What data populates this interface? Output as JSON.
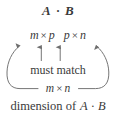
{
  "figure": {
    "caption_product": {
      "left_matrix": "A",
      "operator": "·",
      "right_matrix": "B"
    },
    "dimensions_row": {
      "left": {
        "rows": "m",
        "operator": "×",
        "cols": "p"
      },
      "right": {
        "rows": "p",
        "operator": "×",
        "cols": "n"
      }
    },
    "must_match_label": "must match",
    "result_dimensions": {
      "rows": "m",
      "operator": "×",
      "cols": "n"
    },
    "bottom_caption": {
      "prefix": "dimension of",
      "left_matrix": "A",
      "operator": "·",
      "right_matrix": "B"
    },
    "colors": {
      "background": "#ffffff",
      "text": "#3a3a3a",
      "stroke": "#6e6e6e"
    }
  }
}
